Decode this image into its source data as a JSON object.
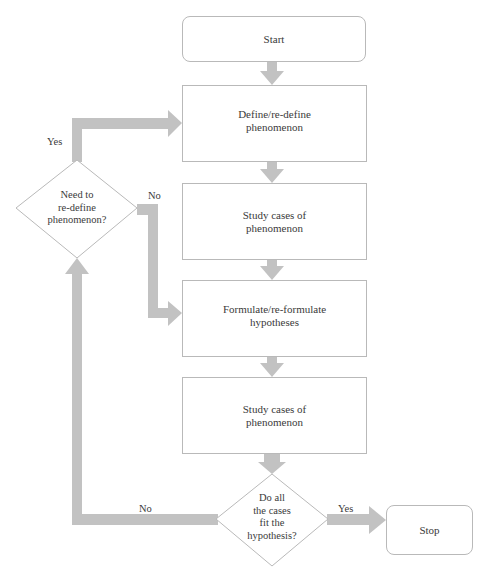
{
  "flowchart": {
    "colors": {
      "arrow": "#c2c2c2",
      "border": "#b9b9b9",
      "text": "#3a3a3a",
      "background": "#ffffff"
    },
    "nodes": {
      "start": {
        "label": "Start",
        "shape": "rounded-rect"
      },
      "define": {
        "label_lines": [
          "Define/re-define",
          "phenomenon"
        ],
        "shape": "rect"
      },
      "study1": {
        "label_lines": [
          "Study cases of",
          "phenomenon"
        ],
        "shape": "rect"
      },
      "formulate": {
        "label_lines": [
          "Formulate/re-formulate",
          "hypotheses"
        ],
        "shape": "rect"
      },
      "study2": {
        "label_lines": [
          "Study cases of",
          "phenomenon"
        ],
        "shape": "rect"
      },
      "decision_fit": {
        "label_lines": [
          "Do all",
          "the cases",
          "fit the",
          "hypothesis?"
        ],
        "shape": "diamond"
      },
      "decision_redefine": {
        "label_lines": [
          "Need to",
          "re-define",
          "phenomenon?"
        ],
        "shape": "diamond"
      },
      "stop": {
        "label": "Stop",
        "shape": "rounded-rect"
      }
    },
    "edge_labels": {
      "redefine_yes": "Yes",
      "redefine_no": "No",
      "fit_no": "No",
      "fit_yes": "Yes"
    },
    "edges": [
      [
        "start",
        "define"
      ],
      [
        "define",
        "study1"
      ],
      [
        "study1",
        "formulate"
      ],
      [
        "formulate",
        "study2"
      ],
      [
        "study2",
        "decision_fit"
      ],
      [
        "decision_fit",
        "stop",
        "Yes"
      ],
      [
        "decision_fit",
        "decision_redefine",
        "No"
      ],
      [
        "decision_redefine",
        "define",
        "Yes"
      ],
      [
        "decision_redefine",
        "formulate",
        "No"
      ]
    ]
  }
}
